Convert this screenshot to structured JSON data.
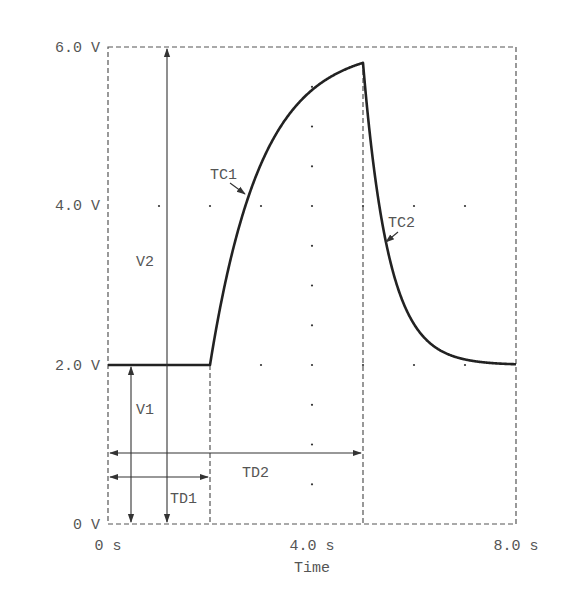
{
  "chart_data": {
    "type": "line",
    "title": "",
    "xlabel": "Time",
    "ylabel": "",
    "xlim": [
      0,
      8
    ],
    "ylim": [
      0,
      6
    ],
    "x_ticks": [
      {
        "value": 0,
        "label": "0 s"
      },
      {
        "value": 4,
        "label": "4.0 s"
      },
      {
        "value": 8,
        "label": "8.0 s"
      }
    ],
    "y_ticks": [
      {
        "value": 0,
        "label": "0 V"
      },
      {
        "value": 2,
        "label": "2.0 V"
      },
      {
        "value": 4,
        "label": "4.0 V"
      },
      {
        "value": 6,
        "label": "6.0 V"
      }
    ],
    "grid": "dots",
    "parameters": {
      "V1": 2.0,
      "V2": 6.0,
      "TD1": 2.0,
      "TD2": 5.0,
      "TC1": 1.0,
      "TC2": 0.5
    },
    "series": [
      {
        "name": "V(t)",
        "x": [
          0,
          2.0,
          2.5,
          3.0,
          3.5,
          4.0,
          4.5,
          5.0,
          5.25,
          5.5,
          6.0,
          6.5,
          7.0,
          7.5,
          8.0
        ],
        "values": [
          2.0,
          2.0,
          3.57,
          4.53,
          5.11,
          5.46,
          5.67,
          5.8,
          4.31,
          3.4,
          2.51,
          2.19,
          2.07,
          2.03,
          2.01
        ]
      }
    ],
    "annotations": [
      {
        "label": "V1",
        "type": "vertical-arrow",
        "from": 0,
        "to": 2.0,
        "x": 0.45
      },
      {
        "label": "V2",
        "type": "vertical-arrow",
        "from": 0,
        "to": 6.0,
        "x": 1.15
      },
      {
        "label": "TD1",
        "type": "horizontal-arrow",
        "from": 0,
        "to": 2.0,
        "y": 0.6
      },
      {
        "label": "TD2",
        "type": "horizontal-arrow",
        "from": 0,
        "to": 5.0,
        "y": 0.9
      },
      {
        "label": "TC1",
        "type": "pointer",
        "target": "rising edge"
      },
      {
        "label": "TC2",
        "type": "pointer",
        "target": "falling edge"
      }
    ]
  },
  "labels": {
    "y0": "0 V",
    "y2": "2.0 V",
    "y4": "4.0 V",
    "y6": "6.0 V",
    "x0": "0 s",
    "x4": "4.0 s",
    "x8": "8.0 s",
    "xlabel": "Time",
    "v1": "V1",
    "v2": "V2",
    "td1": "TD1",
    "td2": "TD2",
    "tc1": "TC1",
    "tc2": "TC2"
  }
}
